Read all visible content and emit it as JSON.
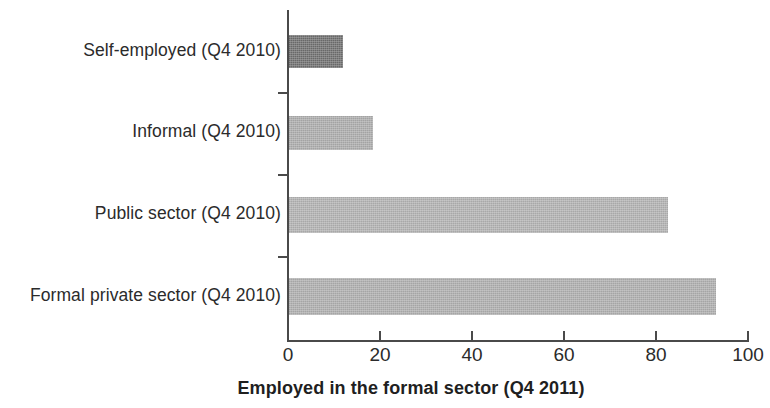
{
  "chart_data": {
    "type": "bar",
    "orientation": "horizontal",
    "title": "",
    "xlabel": "Employed in the formal sector (Q4 2011)",
    "ylabel": "",
    "categories": [
      "Self-employed (Q4 2010)",
      "Informal (Q4 2010)",
      "Public sector (Q4 2010)",
      "Formal private sector (Q4 2010)"
    ],
    "values": [
      12,
      18.5,
      82.5,
      93
    ],
    "xlim": [
      0,
      100
    ],
    "xticks": [
      0,
      20,
      40,
      60,
      80,
      100
    ],
    "xtick_labels": [
      "0",
      "20",
      "40",
      "60",
      "80",
      "100"
    ],
    "grid": false,
    "legend": false,
    "bar_colors": [
      "#6e6e6e",
      "#ababab",
      "#b0b0b0",
      "#adadad"
    ]
  },
  "axis": {
    "title": "Employed in the formal sector (Q4 2011)",
    "ticks": [
      {
        "label": "0",
        "value": 0
      },
      {
        "label": "20",
        "value": 20
      },
      {
        "label": "40",
        "value": 40
      },
      {
        "label": "60",
        "value": 60
      },
      {
        "label": "80",
        "value": 80
      },
      {
        "label": "100",
        "value": 100
      }
    ]
  },
  "bars": [
    {
      "label": "Self-employed (Q4 2010)",
      "value": 12,
      "color": "#6e6e6e"
    },
    {
      "label": "Informal (Q4 2010)",
      "value": 18.5,
      "color": "#ababab"
    },
    {
      "label": "Public sector (Q4 2010)",
      "value": 82.5,
      "color": "#b0b0b0"
    },
    {
      "label": "Formal private sector (Q4 2010)",
      "value": 93,
      "color": "#adadad"
    }
  ]
}
